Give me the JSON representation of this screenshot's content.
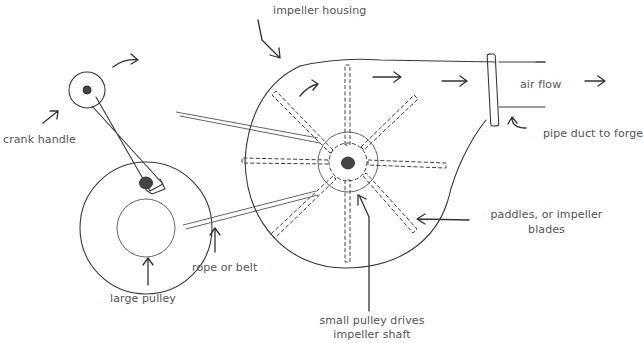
{
  "diagram": {
    "labels": {
      "impeller_housing": "impeller housing",
      "crank_handle": "crank handle",
      "air_flow": "air flow",
      "pipe_duct": "pipe duct to forge",
      "paddles_line1": "paddles, or impeller",
      "paddles_line2": "blades",
      "large_pulley": "large pulley",
      "rope_or_belt": "rope or belt",
      "small_pulley_line1": "small pulley drives",
      "small_pulley_line2": "impeller shaft"
    },
    "colors": {
      "line": "#3a3a3a",
      "text": "#555555",
      "background": "#ffffff"
    }
  }
}
